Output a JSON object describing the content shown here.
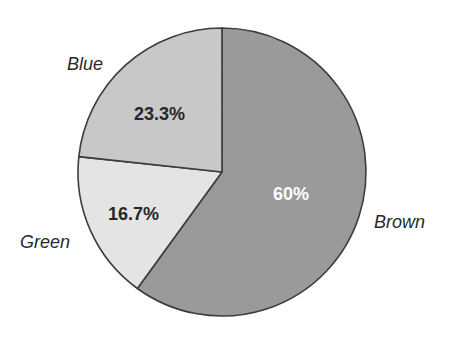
{
  "chart_data": {
    "type": "pie",
    "title": "",
    "start_angle_deg": 0,
    "direction": "clockwise",
    "categories": [
      "Brown",
      "Green",
      "Blue"
    ],
    "values": [
      60,
      16.7,
      23.3
    ],
    "value_labels": [
      "60%",
      "16.7%",
      "23.3%"
    ],
    "colors": [
      "#9a9a9a",
      "#e4e4e4",
      "#c8c8c8"
    ],
    "label_colors": [
      "#ffffff",
      "#262626",
      "#262626"
    ],
    "outline_color": "#3c3c3c",
    "legend": "none",
    "label_position": "outside for category, inside for percentage"
  },
  "geometry": {
    "cx": 222,
    "cy": 172,
    "r": 144
  },
  "labels": {
    "brown": {
      "name": "Brown",
      "pct": "60%",
      "name_x": 374,
      "name_y": 228,
      "pct_x": 273,
      "pct_y": 200
    },
    "green": {
      "name": "Green",
      "pct": "16.7%",
      "name_x": 20,
      "name_y": 248,
      "pct_x": 108,
      "pct_y": 220
    },
    "blue": {
      "name": "Blue",
      "pct": "23.3%",
      "name_x": 67,
      "name_y": 70,
      "pct_x": 134,
      "pct_y": 120
    }
  }
}
